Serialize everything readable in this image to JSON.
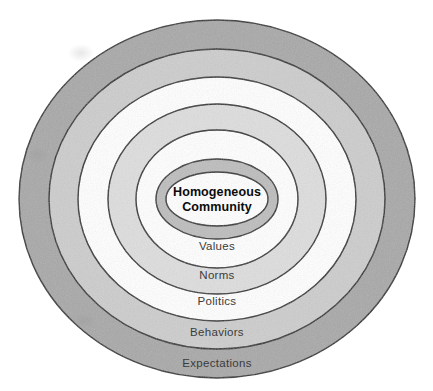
{
  "figure": {
    "type": "concentric-rings-diagram",
    "background_color": "#ffffff",
    "center": {
      "x": 217,
      "y": 199
    },
    "outline_color": "#2b2b2b",
    "outline_width": 1.4
  },
  "center_node": {
    "label_line_1": "Homogeneous",
    "label_line_2": "Community",
    "full_label": "Homogeneous Community",
    "fill_color": "#ffffff",
    "text_color": "#0b0b0b",
    "rx": 51,
    "ry": 27,
    "label_x": 217,
    "label_y": 200
  },
  "rings": [
    {
      "index": 1,
      "label": "Expectations",
      "fill_color": "#a8a8a8",
      "text_color": "#3b3b3b",
      "rx": 198,
      "ry": 179,
      "label_x": 217,
      "label_y": 363
    },
    {
      "index": 2,
      "label": "Behaviors",
      "fill_color": "#cdcdcd",
      "text_color": "#3b3b3b",
      "rx": 168,
      "ry": 150,
      "label_x": 217,
      "label_y": 332
    },
    {
      "index": 3,
      "label": "Politics",
      "fill_color": "#ffffff",
      "text_color": "#3b3b3b",
      "rx": 139,
      "ry": 122,
      "label_x": 217,
      "label_y": 301
    },
    {
      "index": 4,
      "label": "Norms",
      "fill_color": "#dedede",
      "text_color": "#3b3b3b",
      "rx": 109,
      "ry": 95,
      "label_x": 217,
      "label_y": 275
    },
    {
      "index": 5,
      "label": "Values",
      "fill_color": "#ffffff",
      "text_color": "#3b3b3b",
      "rx": 81,
      "ry": 69,
      "label_x": 217,
      "label_y": 246
    },
    {
      "index": 6,
      "label": "",
      "fill_color": "#bdbdbd",
      "text_color": "#3b3b3b",
      "rx": 61,
      "ry": 40,
      "label_x": 217,
      "label_y": 220
    }
  ]
}
